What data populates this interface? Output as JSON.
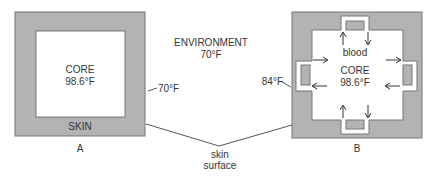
{
  "environment": {
    "label": "ENVIRONMENT",
    "temp": "70°F"
  },
  "diagram_a": {
    "caption": "A",
    "core_label": "CORE",
    "core_temp": "98.6°F",
    "skin_label": "SKIN",
    "surface_temp": "70°F"
  },
  "diagram_b": {
    "caption": "B",
    "core_label": "CORE",
    "core_temp": "98.6°F",
    "blood_label": "blood",
    "surface_temp": "84°F"
  },
  "skin_surface_label": {
    "line1": "skin",
    "line2": "surface"
  },
  "colors": {
    "skin": "#b3b3b3",
    "outline": "#777777",
    "text": "#333333"
  }
}
